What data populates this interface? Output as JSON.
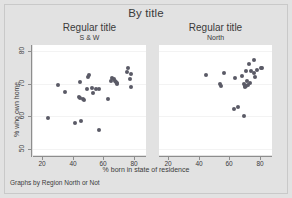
{
  "figure": {
    "main_title": "By title",
    "caption": "Graphs by Region North or Not",
    "background_color": "#e2e2e2",
    "plot_background_color": "#ffffff",
    "marker_color": "#5a5a66",
    "axis_color": "#8d8d8d"
  },
  "axes": {
    "xlabel": "% born in state of residence",
    "ylabel": "% who own home",
    "xticks": [
      "20",
      "40",
      "60",
      "80"
    ],
    "yticks": [
      "80",
      "70",
      "60",
      "50"
    ],
    "xlim": [
      14,
      88
    ],
    "ylim": [
      48,
      82
    ]
  },
  "chart_data": {
    "type": "scatter",
    "title": "By title",
    "xlabel": "% born in state of residence",
    "ylabel": "% who own home",
    "xlim": [
      14,
      88
    ],
    "ylim": [
      48,
      82
    ],
    "xticks": [
      20,
      40,
      60,
      80
    ],
    "yticks": [
      50,
      60,
      70,
      80
    ],
    "grid": true,
    "legend": "none",
    "caption": "Graphs by Region North or Not",
    "panels": [
      {
        "title": "Regular title",
        "subtitle": "S & W",
        "points": [
          [
            23.5,
            59.3
          ],
          [
            30.3,
            69.6
          ],
          [
            34.8,
            67.6
          ],
          [
            41.5,
            58.0
          ],
          [
            44.0,
            65.8
          ],
          [
            44.6,
            70.7
          ],
          [
            45.0,
            65.5
          ],
          [
            45.7,
            58.4
          ],
          [
            46.5,
            65.3
          ],
          [
            47.3,
            65.1
          ],
          [
            49.5,
            68.4
          ],
          [
            50.2,
            72.2
          ],
          [
            50.8,
            72.8
          ],
          [
            52.5,
            68.6
          ],
          [
            53.5,
            67.3
          ],
          [
            55.5,
            68.3
          ],
          [
            57.0,
            55.7
          ],
          [
            57.5,
            68.4
          ],
          [
            63.0,
            65.3
          ],
          [
            64.8,
            71.0
          ],
          [
            66.0,
            71.8
          ],
          [
            66.8,
            71.4
          ],
          [
            67.5,
            71.0
          ],
          [
            68.2,
            70.6
          ],
          [
            68.8,
            70.2
          ],
          [
            69.3,
            69.8
          ],
          [
            75.5,
            73.6
          ],
          [
            76.5,
            74.9
          ],
          [
            77.2,
            71.5
          ],
          [
            78.0,
            73.1
          ],
          [
            78.5,
            68.9
          ]
        ]
      },
      {
        "title": "Regular title",
        "subtitle": "North",
        "points": [
          [
            44.8,
            72.8
          ],
          [
            54.0,
            69.9
          ],
          [
            54.8,
            69.4
          ],
          [
            56.5,
            73.4
          ],
          [
            63.0,
            62.2
          ],
          [
            63.5,
            71.8
          ],
          [
            66.0,
            62.9
          ],
          [
            68.5,
            72.5
          ],
          [
            69.5,
            69.8
          ],
          [
            69.8,
            60.2
          ],
          [
            70.0,
            69.4
          ],
          [
            70.3,
            69.0
          ],
          [
            70.8,
            74.1
          ],
          [
            71.2,
            69.2
          ],
          [
            71.8,
            70.8
          ],
          [
            72.5,
            69.5
          ],
          [
            73.0,
            76.0
          ],
          [
            73.6,
            70.4
          ],
          [
            74.5,
            74.0
          ],
          [
            76.0,
            73.3
          ],
          [
            76.5,
            77.4
          ],
          [
            77.0,
            72.0
          ],
          [
            78.5,
            74.2
          ],
          [
            80.5,
            74.8
          ],
          [
            81.5,
            74.9
          ]
        ]
      }
    ]
  }
}
